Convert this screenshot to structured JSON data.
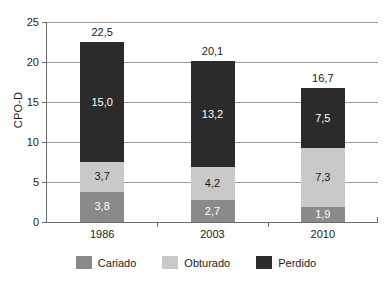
{
  "chart_data": {
    "type": "bar",
    "variant": "stacked",
    "title": "",
    "xlabel": "",
    "ylabel": "CPO-D",
    "categories": [
      "1986",
      "2003",
      "2010"
    ],
    "ylim": [
      0,
      25
    ],
    "yticks": [
      0,
      5,
      10,
      15,
      20,
      25
    ],
    "ytick_labels": [
      "0",
      "5",
      "10",
      "15",
      "20",
      "25"
    ],
    "grid": true,
    "legend_position": "bottom",
    "decimal_separator": ",",
    "series": [
      {
        "name": "Cariado",
        "color": "#8a8a8a",
        "values": [
          3.8,
          2.7,
          1.9
        ],
        "labels": [
          "3,8",
          "2,7",
          "1,9"
        ]
      },
      {
        "name": "Obturado",
        "color": "#c9c9c9",
        "values": [
          3.7,
          4.2,
          7.3
        ],
        "labels": [
          "3,7",
          "4,2",
          "7,3"
        ]
      },
      {
        "name": "Perdido",
        "color": "#2b2b2b",
        "values": [
          15.0,
          13.2,
          7.5
        ],
        "labels": [
          "15,0",
          "13,2",
          "7,5"
        ]
      }
    ],
    "totals": [
      22.5,
      20.1,
      16.7
    ],
    "total_labels": [
      "22,5",
      "20,1",
      "16,7"
    ]
  },
  "axis": {
    "y_title": "CPO-D"
  },
  "legend": {
    "items": [
      {
        "label": "Cariado"
      },
      {
        "label": "Obturado"
      },
      {
        "label": "Perdido"
      }
    ]
  },
  "caption": {
    "ghost_line": ""
  }
}
